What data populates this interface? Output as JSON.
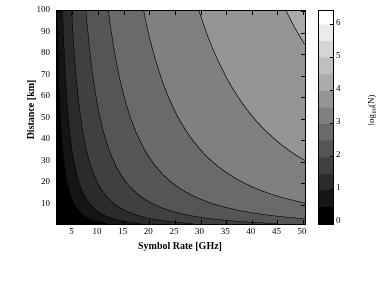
{
  "chart_data": {
    "type": "heatmap",
    "title": "",
    "subtitle": "",
    "xlabel": "Symbol Rate [GHz]",
    "ylabel": "Distance [km]",
    "xlim": [
      2,
      50
    ],
    "ylim": [
      2,
      100
    ],
    "xticks": [
      5,
      10,
      15,
      20,
      25,
      30,
      35,
      40,
      45,
      50
    ],
    "yticks": [
      10,
      20,
      30,
      40,
      50,
      60,
      70,
      80,
      90,
      100
    ],
    "grid": false,
    "legend": "none",
    "colorbar": {
      "label": "log10(N)",
      "label_base": "log",
      "label_sub": "10",
      "label_tail": "(N)",
      "ticks": [
        0,
        1,
        2,
        3,
        4,
        5,
        6
      ],
      "range": [
        0,
        6.4
      ],
      "colormap": "grayscale-black-to-white",
      "position": "right"
    },
    "z_description": "log10 of number of operations N as a function of symbol rate and distance",
    "contour_levels": [
      0.5,
      1,
      1.5,
      2,
      2.5,
      3,
      3.5,
      4,
      4.5,
      5,
      5.5,
      6
    ],
    "contour_line_color": "#000000",
    "surface_expression": "z = log10(symbol_rate^2 * distance), filled contour, dark at low rate/distance, bright at high rate/distance"
  }
}
